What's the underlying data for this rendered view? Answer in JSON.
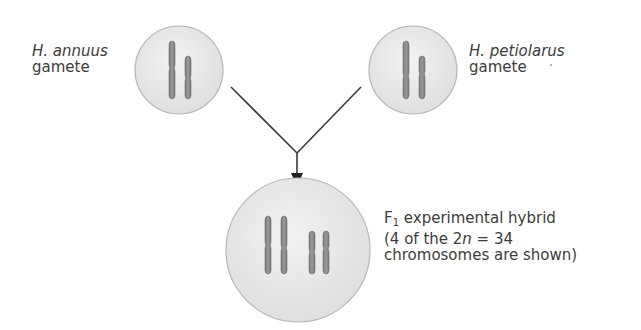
{
  "diagram": {
    "type": "hybridization-cross",
    "colors": {
      "cell_fill": "#e9e9e9",
      "cell_stroke": "#b5b5b5",
      "chromosome": "#8c8c8c",
      "chromosome_stroke": "#6e6e6e",
      "arrow": "#3a3a3a",
      "text": "#3c3c3c"
    },
    "parents": [
      {
        "id": "h-annuus",
        "species": "H. annuus",
        "role": "gamete",
        "chromosomes": 2
      },
      {
        "id": "h-petiolarus",
        "species": "H. petiolarus",
        "role": "gamete",
        "chromosomes": 2
      }
    ],
    "offspring": {
      "id": "f1-hybrid",
      "generation_base": "F",
      "generation_sub": "1",
      "line1_rest": " experimental hybrid",
      "line2_prefix": "(4 of the 2",
      "line2_italic": "n",
      "line2_suffix": " = 34",
      "line3": "chromosomes are shown)",
      "chromosomes": 4
    }
  }
}
